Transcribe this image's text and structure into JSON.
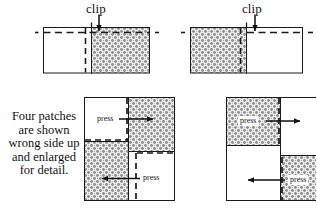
{
  "figure": {
    "caption_lines": [
      "Four patches",
      "are shown",
      "wrong side up",
      "and enlarged",
      "for detail."
    ],
    "colors": {
      "outline": "#1a1a1a",
      "fabric_fill": "#ffffff",
      "shaded_fabric": "#c9c9c9",
      "dashed_stitch": "#1a1a1a",
      "background": "#ffffff"
    },
    "panels": [
      {
        "id": "top-left",
        "name": "top-left-patch-pair",
        "clip_label": "clip",
        "description": "Two patches seamed together, right patch shaded, dashed seam line running horizontally, clip mark at the seam intersection."
      },
      {
        "id": "top-right",
        "name": "top-right-patch-pair",
        "clip_label": "clip",
        "description": "Mirror image of top-left: shaded patch on the left, plain patch on the right, clip mark at the seam intersection."
      },
      {
        "id": "bottom-left",
        "name": "bottom-left-four-patch",
        "press_labels": [
          "press",
          "press"
        ],
        "description": "Four-patch assembly showing two press direction arrows, upper arrow pointing right, lower arrow pointing left."
      },
      {
        "id": "bottom-right",
        "name": "bottom-right-four-patch",
        "press_labels": [
          "press",
          "press"
        ],
        "description": "Mirrored four-patch assembly showing two press direction arrows, upper arrow pointing right, lower arrow pointing left."
      }
    ]
  }
}
